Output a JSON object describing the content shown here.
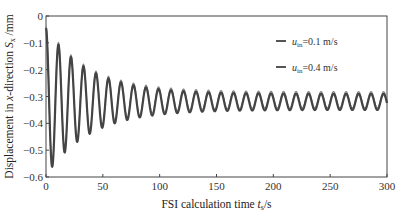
{
  "chart_data": {
    "type": "line",
    "title": "",
    "xlabel": "FSI calculation time t_s /s",
    "xlabel_parts": {
      "main": "FSI calculation time ",
      "var": "t",
      "sub": "s",
      "unit": "/s"
    },
    "ylabel": "Displacement in x-direction S_x /mm",
    "ylabel_parts": {
      "pre": "Displacement in ",
      "var1": "x",
      "mid": "-direction ",
      "var2": "S",
      "sub": "x",
      "unit": " /mm"
    },
    "xlim": [
      0,
      300
    ],
    "ylim": [
      -0.6,
      0
    ],
    "xticks": [
      0,
      50,
      100,
      150,
      200,
      250,
      300
    ],
    "yticks": [
      0,
      -0.1,
      -0.2,
      -0.3,
      -0.4,
      -0.5,
      -0.6
    ],
    "ytick_labels": [
      "0",
      "−0.1",
      "−0.2",
      "−0.3",
      "−0.4",
      "−0.5",
      "−0.6"
    ],
    "grid": false,
    "legend_position": "top-right",
    "model": {
      "description": "Damped oscillation: mean -0.32, initial amplitude ~0.28 decaying to ~0.03, period ~11 s",
      "mean": -0.32,
      "period_s": 11,
      "initial_amplitude": 0.275,
      "final_amplitude": 0.03,
      "decay_time_s": 38
    },
    "key_points": [
      {
        "t": 0,
        "value": -0.045
      },
      {
        "t": 5,
        "value": -0.59
      },
      {
        "t": 11,
        "value": -0.105
      },
      {
        "t": 16,
        "value": -0.55
      },
      {
        "t": 21,
        "value": -0.145
      },
      {
        "t": 300,
        "value": -0.32
      }
    ],
    "series": [
      {
        "name": "u_in=0.1 m/s",
        "label_var": "u",
        "label_sub": "in",
        "label_rest": "=0.1 m/s",
        "color": "#444444",
        "offset": 0.0
      },
      {
        "name": "u_in=0.4 m/s",
        "label_var": "u",
        "label_sub": "in",
        "label_rest": "=0.4 m/s",
        "color": "#8a8a8a",
        "offset": 0.008
      }
    ]
  }
}
